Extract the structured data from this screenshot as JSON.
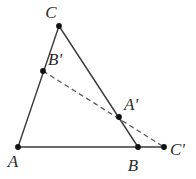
{
  "figure": {
    "background_color": "#ffffff",
    "stroke_color": "#3a3a3a",
    "dash_color": "#5a5a5a",
    "point_color": "#111111",
    "label_color": "#2b2b2b",
    "width": 196,
    "height": 179
  },
  "points": {
    "A": {
      "label": "A",
      "x": 18,
      "y": 147,
      "label_x": 13,
      "label_y": 167
    },
    "B": {
      "label": "B",
      "x": 138,
      "y": 147,
      "label_x": 133,
      "label_y": 171
    },
    "C": {
      "label": "C",
      "x": 59,
      "y": 26,
      "label_x": 51,
      "label_y": 18
    },
    "Ap": {
      "label": "A'",
      "x": 119,
      "y": 117,
      "label_x": 124,
      "label_y": 110
    },
    "Bp": {
      "label": "B'",
      "x": 43,
      "y": 71,
      "label_x": 48,
      "label_y": 65
    },
    "Cp": {
      "label": "C'",
      "x": 164,
      "y": 147,
      "label_x": 170,
      "label_y": 155
    }
  },
  "segments": {
    "side_AC": {
      "name": "A to C",
      "x1": 18,
      "y1": 147,
      "x2": 59,
      "y2": 26,
      "style": "solid"
    },
    "side_CB": {
      "name": "C to B",
      "x1": 59,
      "y1": 26,
      "x2": 138,
      "y2": 147,
      "style": "solid"
    },
    "base_A_to_Cp": {
      "name": "A to C'",
      "x1": 18,
      "y1": 147,
      "x2": 164,
      "y2": 147,
      "style": "solid"
    },
    "transversal": {
      "name": "B' to C' through A'",
      "x1": 43,
      "y1": 71,
      "x2": 164,
      "y2": 147,
      "style": "dashed"
    }
  },
  "style_values": {
    "stroke_width": "1.4",
    "dash_pattern": "5,3.5",
    "point_radius": "2.9"
  }
}
